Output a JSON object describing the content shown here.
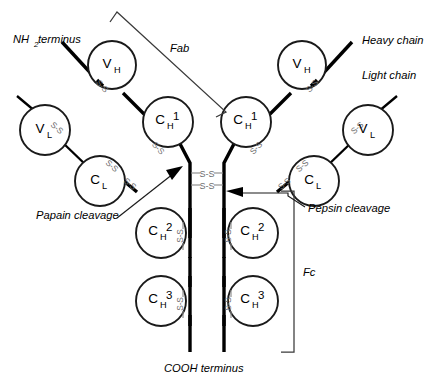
{
  "figure": {
    "title_present": false,
    "background_color": "#ffffff",
    "ink_color": "#000000",
    "disulfide_color": "#8c8c8c"
  },
  "terminus_labels": {
    "n_terminus_prefix": "NH",
    "n_terminus_subscript": "2",
    "n_terminus_suffix": " terminus",
    "c_terminus": "COOH terminus"
  },
  "chain_labels": {
    "heavy": "Heavy chain",
    "light": "Light chain"
  },
  "region_labels": {
    "fab": "Fab",
    "fc": "Fc"
  },
  "cleavage_labels": {
    "papain": "Papain cleavage",
    "pepsin": "Pepsin cleavage"
  },
  "domains": [
    {
      "id": "vh-left",
      "base": "V",
      "sub": "H",
      "num": "",
      "cx": 112,
      "cy": 65,
      "r": 24
    },
    {
      "id": "vl-left",
      "base": "V",
      "sub": "L",
      "num": "",
      "cx": 45,
      "cy": 130,
      "r": 25
    },
    {
      "id": "ch1-left",
      "base": "C",
      "sub": "H",
      "num": "1",
      "cx": 168,
      "cy": 122,
      "r": 25
    },
    {
      "id": "cl-left",
      "base": "C",
      "sub": "L",
      "num": "",
      "cx": 100,
      "cy": 181,
      "r": 25
    },
    {
      "id": "ch2-left",
      "base": "C",
      "sub": "H",
      "num": "2",
      "cx": 161,
      "cy": 233,
      "r": 25
    },
    {
      "id": "ch3-left",
      "base": "C",
      "sub": "H",
      "num": "3",
      "cx": 161,
      "cy": 301,
      "r": 25
    },
    {
      "id": "vh-right",
      "base": "V",
      "sub": "H",
      "num": "",
      "cx": 302,
      "cy": 65,
      "r": 24
    },
    {
      "id": "vl-right",
      "base": "V",
      "sub": "L",
      "num": "",
      "cx": 368,
      "cy": 130,
      "r": 25
    },
    {
      "id": "ch1-right",
      "base": "C",
      "sub": "H",
      "num": "1",
      "cx": 246,
      "cy": 122,
      "r": 25
    },
    {
      "id": "cl-right",
      "base": "C",
      "sub": "L",
      "num": "",
      "cx": 314,
      "cy": 181,
      "r": 25
    },
    {
      "id": "ch2-right",
      "base": "C",
      "sub": "H",
      "num": "2",
      "cx": 253,
      "cy": 233,
      "r": 25
    },
    {
      "id": "ch3-right",
      "base": "C",
      "sub": "H",
      "num": "3",
      "cx": 253,
      "cy": 301,
      "r": 25
    }
  ],
  "hinge_disulfides": {
    "label": "S-S",
    "count": 2,
    "rows": [
      {
        "y": 173,
        "left_text_x": 198,
        "right_text_x": 216
      },
      {
        "y": 184,
        "left_text_x": 198,
        "right_text_x": 216
      }
    ]
  },
  "interchain_disulfides": {
    "label": "S-S",
    "count": 10
  }
}
